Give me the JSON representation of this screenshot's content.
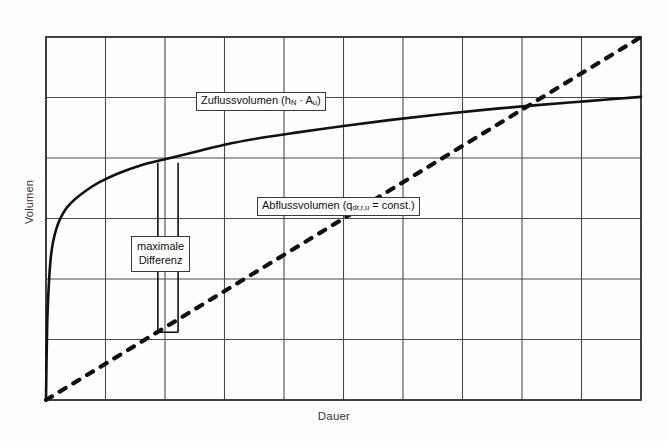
{
  "chart_data": {
    "type": "line",
    "title": "",
    "xlabel": "Dauer",
    "ylabel": "Volumen",
    "xlim": [
      0,
      10
    ],
    "ylim": [
      0,
      6
    ],
    "grid": true,
    "grid_columns": 10,
    "grid_rows": 6,
    "axis_ticks_labeled": false,
    "legend": "inline-callouts",
    "series": [
      {
        "name": "Zuflussvolumen (hN · Au)",
        "style": "solid",
        "color": "#111111",
        "width": 2.6,
        "description": "Summenlinie des Zuflusses, wurzel-/logarithmisch ansteigend, stark gekruemmt am Anfang, danach flach auslaufend",
        "points": [
          [
            0.0,
            0.0
          ],
          [
            0.02,
            1.25
          ],
          [
            0.05,
            1.95
          ],
          [
            0.08,
            2.35
          ],
          [
            0.12,
            2.62
          ],
          [
            0.18,
            2.85
          ],
          [
            0.25,
            3.02
          ],
          [
            0.35,
            3.18
          ],
          [
            0.5,
            3.33
          ],
          [
            0.7,
            3.48
          ],
          [
            0.9,
            3.6
          ],
          [
            1.2,
            3.74
          ],
          [
            1.6,
            3.88
          ],
          [
            2.0,
            3.98
          ],
          [
            2.5,
            4.1
          ],
          [
            3.0,
            4.22
          ],
          [
            3.6,
            4.33
          ],
          [
            4.2,
            4.42
          ],
          [
            5.0,
            4.53
          ],
          [
            5.8,
            4.63
          ],
          [
            6.6,
            4.72
          ],
          [
            7.4,
            4.8
          ],
          [
            8.2,
            4.87
          ],
          [
            9.1,
            4.94
          ],
          [
            10.0,
            5.01
          ]
        ]
      },
      {
        "name": "Abflussvolumen (qdr,r,u = const.)",
        "style": "dashed",
        "color": "#111111",
        "width": 3.0,
        "description": "Konstante Drosselabgabe, lineare Summenlinie vom Ursprung",
        "points": [
          [
            0.0,
            0.0
          ],
          [
            10.0,
            6.0
          ]
        ]
      }
    ],
    "annotations": [
      {
        "name": "maximale Differenz",
        "type": "vertical-bracket",
        "text_line_1": "maximale",
        "text_line_2": "Differenz",
        "x_left": 1.88,
        "x_right": 2.22,
        "y_top": 3.92,
        "y_bottom": 1.12,
        "meaning": "Maximaler vertikaler Abstand zwischen Zufluss- und Abflusssummenlinie = erforderliches Speichervolumen"
      }
    ],
    "crossing_point": {
      "x": 8.38,
      "y": 5.03
    }
  },
  "axes": {
    "y_title": "Volumen",
    "x_title": "Dauer"
  },
  "labels": {
    "zufluss": {
      "pre": "Zuflussvolumen (h",
      "sub1": "N",
      "mid": " · A",
      "sub2": "u",
      "post": ")"
    },
    "abfluss": {
      "pre": "Abflussvolumen (q",
      "sub1": "dr,r,u",
      "post": " = const.)"
    },
    "maxdiff": {
      "line1": "maximale",
      "line2": "Differenz"
    }
  },
  "colors": {
    "line": "#111111",
    "grid": "#4a4a4a",
    "frame": "#2e2e2e",
    "background": "#fefefe",
    "text": "#1a1a1a"
  }
}
